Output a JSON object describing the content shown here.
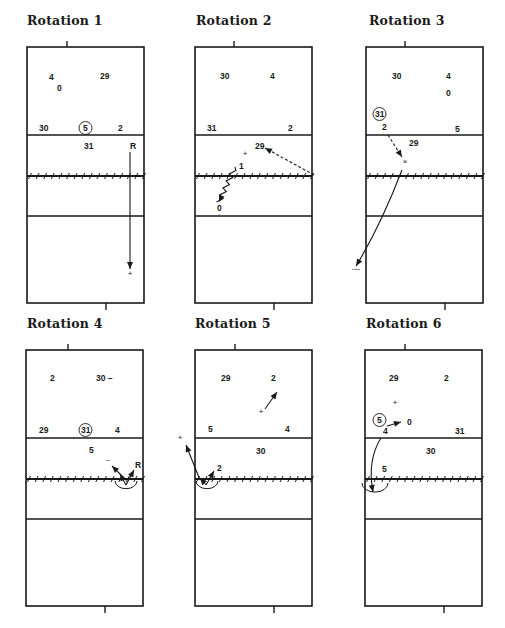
{
  "figure": {
    "colors": {
      "ink": "#1a1a1a",
      "background": "#ffffff"
    },
    "court": {
      "width": 117,
      "height": 256,
      "attack_line_1": 88,
      "net": 129,
      "attack_line_2": 169
    }
  },
  "rotations": [
    {
      "title": "Rotation 1",
      "title_pos": [
        27,
        22
      ],
      "origin": [
        27,
        47
      ],
      "top_tick_x": 40,
      "bottom_tick_x": 79,
      "players": [
        {
          "label": "4",
          "x": 22,
          "y": 33
        },
        {
          "label": "0",
          "x": 30,
          "y": 44
        },
        {
          "label": "29",
          "x": 73,
          "y": 32
        },
        {
          "label": "30",
          "x": 12,
          "y": 84
        },
        {
          "label": "5",
          "x": 56,
          "y": 84,
          "circled": true
        },
        {
          "label": "2",
          "x": 91,
          "y": 84
        },
        {
          "label": "31",
          "x": 57,
          "y": 102
        },
        {
          "label": "R",
          "x": 103,
          "y": 102
        }
      ],
      "markers": [
        {
          "symbol": "+",
          "x": 103,
          "y": 229
        }
      ],
      "arrows": [
        {
          "style": "solid",
          "points": [
            [
              103,
              105
            ],
            [
              103,
              222
            ]
          ]
        }
      ],
      "arcs": []
    },
    {
      "title": "Rotation 2",
      "title_pos": [
        196,
        22
      ],
      "origin": [
        195,
        47
      ],
      "top_tick_x": 39,
      "bottom_tick_x": 79,
      "players": [
        {
          "label": "30",
          "x": 25,
          "y": 32
        },
        {
          "label": "4",
          "x": 75,
          "y": 32
        },
        {
          "label": "31",
          "x": 12,
          "y": 84
        },
        {
          "label": "2",
          "x": 93,
          "y": 84
        },
        {
          "label": "29",
          "x": 60,
          "y": 102
        },
        {
          "label": "1",
          "x": 44,
          "y": 122
        },
        {
          "label": "0",
          "x": 22,
          "y": 164
        }
      ],
      "markers": [
        {
          "symbol": "+",
          "x": 50,
          "y": 109
        },
        {
          "symbol": ".",
          "x": 24,
          "y": 168
        }
      ],
      "arrows": [
        {
          "style": "dashed",
          "points": [
            [
              119,
              128
            ],
            [
              70,
              101
            ]
          ]
        },
        {
          "style": "zigzag",
          "points": [
            [
              40,
              120
            ],
            [
              24,
              155
            ]
          ]
        }
      ],
      "arcs": []
    },
    {
      "title": "Rotation 3",
      "title_pos": [
        369,
        22
      ],
      "origin": [
        366,
        47
      ],
      "top_tick_x": 39,
      "bottom_tick_x": 79,
      "players": [
        {
          "label": "30",
          "x": 26,
          "y": 32
        },
        {
          "label": "4",
          "x": 80,
          "y": 32
        },
        {
          "label": "0",
          "x": 80,
          "y": 49
        },
        {
          "label": "31",
          "x": 9,
          "y": 70,
          "circled": true
        },
        {
          "label": "2",
          "x": 16,
          "y": 83
        },
        {
          "label": "5",
          "x": 89,
          "y": 85
        },
        {
          "label": "29",
          "x": 43,
          "y": 99
        }
      ],
      "markers": [
        {
          "symbol": "×",
          "x": 39,
          "y": 117
        },
        {
          "symbol": "—",
          "x": -10,
          "y": 224
        }
      ],
      "arrows": [
        {
          "style": "dashed",
          "points": [
            [
              22,
              88
            ],
            [
              36,
              110
            ]
          ]
        },
        {
          "style": "solid-curve",
          "points": [
            [
              36,
              123
            ],
            [
              14,
              180
            ],
            [
              -10,
              219
            ]
          ]
        }
      ],
      "arcs": []
    },
    {
      "title": "Rotation 4",
      "title_pos": [
        27,
        325
      ],
      "origin": [
        26,
        350
      ],
      "top_tick_x": 42,
      "bottom_tick_x": 79,
      "players": [
        {
          "label": "2",
          "x": 24,
          "y": 31
        },
        {
          "label": "30 –",
          "x": 70,
          "y": 31
        },
        {
          "label": "29",
          "x": 13,
          "y": 83
        },
        {
          "label": "31",
          "x": 55,
          "y": 83,
          "circled": true
        },
        {
          "label": "4",
          "x": 89,
          "y": 83
        },
        {
          "label": "5",
          "x": 63,
          "y": 103
        },
        {
          "label": "R",
          "x": 109,
          "y": 118
        }
      ],
      "markers": [
        {
          "symbol": "–",
          "x": 82,
          "y": 112
        }
      ],
      "arrows": [
        {
          "style": "solid",
          "points": [
            [
              100,
              130
            ],
            [
              86,
              116
            ]
          ]
        },
        {
          "style": "solid",
          "points": [
            [
              100,
              135
            ],
            [
              108,
              120
            ]
          ]
        },
        {
          "style": "solid",
          "points": [
            [
              100,
              135
            ],
            [
              94,
              124
            ]
          ]
        }
      ],
      "arcs": [
        {
          "cx": 100,
          "cy": 131,
          "r": 11
        }
      ]
    },
    {
      "title": "Rotation 5",
      "title_pos": [
        195,
        325
      ],
      "origin": [
        195,
        350
      ],
      "top_tick_x": 40,
      "bottom_tick_x": 79,
      "players": [
        {
          "label": "29",
          "x": 26,
          "y": 31
        },
        {
          "label": "2",
          "x": 76,
          "y": 31
        },
        {
          "label": "5",
          "x": 13,
          "y": 82
        },
        {
          "label": "4",
          "x": 90,
          "y": 82
        },
        {
          "label": "30",
          "x": 61,
          "y": 104
        },
        {
          "label": "2",
          "x": 22,
          "y": 121
        }
      ],
      "markers": [
        {
          "symbol": "+",
          "x": 66,
          "y": 64
        },
        {
          "symbol": "+",
          "x": -15,
          "y": 90
        }
      ],
      "arrows": [
        {
          "style": "solid",
          "points": [
            [
              70,
              59
            ],
            [
              82,
              42
            ]
          ]
        },
        {
          "style": "solid",
          "points": [
            [
              5,
              130
            ],
            [
              -9,
              95
            ]
          ]
        },
        {
          "style": "solid",
          "points": [
            [
              11,
              135
            ],
            [
              19,
              121
            ]
          ]
        },
        {
          "style": "solid",
          "points": [
            [
              11,
              135
            ],
            [
              5,
              128
            ]
          ]
        }
      ],
      "arcs": [
        {
          "cx": 12,
          "cy": 131,
          "r": 11
        }
      ]
    },
    {
      "title": "Rotation 6",
      "title_pos": [
        366,
        325
      ],
      "origin": [
        365,
        350
      ],
      "top_tick_x": 40,
      "bottom_tick_x": 79,
      "players": [
        {
          "label": "29",
          "x": 24,
          "y": 31
        },
        {
          "label": "2",
          "x": 79,
          "y": 31
        },
        {
          "label": "5",
          "x": 12,
          "y": 73,
          "circled": true
        },
        {
          "label": "0",
          "x": 42,
          "y": 75
        },
        {
          "label": "4",
          "x": 18,
          "y": 84
        },
        {
          "label": "31",
          "x": 90,
          "y": 84
        },
        {
          "label": "30",
          "x": 61,
          "y": 104
        },
        {
          "label": "5",
          "x": 17,
          "y": 122
        }
      ],
      "markers": [
        {
          "symbol": "+",
          "x": 30,
          "y": 55
        }
      ],
      "arrows": [
        {
          "style": "solid",
          "points": [
            [
              22,
              76
            ],
            [
              36,
              72
            ]
          ]
        },
        {
          "style": "solid-curve",
          "points": [
            [
              16,
              88
            ],
            [
              2,
              110
            ],
            [
              8,
              142
            ]
          ]
        }
      ],
      "arcs": [
        {
          "cx": 10,
          "cy": 133,
          "r": 13
        }
      ]
    }
  ]
}
